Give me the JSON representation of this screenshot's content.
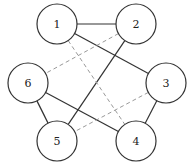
{
  "graph": {
    "radius": 20,
    "nodes": [
      {
        "id": "1",
        "label": "1",
        "x": 57,
        "y": 24
      },
      {
        "id": "2",
        "label": "2",
        "x": 136,
        "y": 24
      },
      {
        "id": "3",
        "label": "3",
        "x": 166,
        "y": 83
      },
      {
        "id": "4",
        "label": "4",
        "x": 136,
        "y": 141
      },
      {
        "id": "5",
        "label": "5",
        "x": 57,
        "y": 141
      },
      {
        "id": "6",
        "label": "6",
        "x": 28,
        "y": 83
      }
    ],
    "edges": [
      {
        "from": "1",
        "to": "2",
        "style": "solid"
      },
      {
        "from": "1",
        "to": "3",
        "style": "solid"
      },
      {
        "from": "2",
        "to": "5",
        "style": "solid"
      },
      {
        "from": "6",
        "to": "4",
        "style": "solid"
      },
      {
        "from": "6",
        "to": "5",
        "style": "solid"
      },
      {
        "from": "3",
        "to": "4",
        "style": "solid"
      },
      {
        "from": "2",
        "to": "6",
        "style": "dashed"
      },
      {
        "from": "1",
        "to": "4",
        "style": "dashed"
      },
      {
        "from": "3",
        "to": "5",
        "style": "dashed"
      }
    ]
  }
}
